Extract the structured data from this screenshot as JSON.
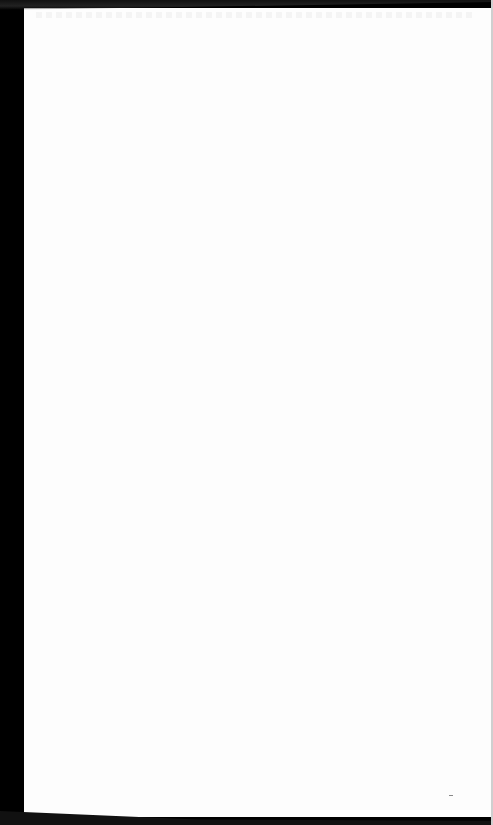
{
  "document": {
    "type": "blank scanned page",
    "text": "",
    "colors": {
      "paper": "#fdfdfd",
      "border": "#000000"
    }
  }
}
